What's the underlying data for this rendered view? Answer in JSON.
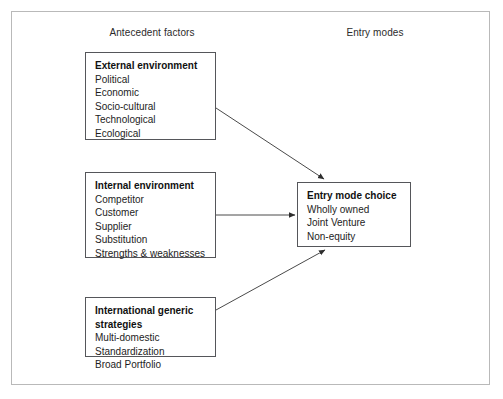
{
  "diagram": {
    "headers": {
      "left": "Antecedent factors",
      "right": "Entry modes"
    },
    "boxes": {
      "external": {
        "title": "External environment",
        "items": [
          "Political",
          "Economic",
          "Socio-cultural",
          "Technological",
          "Ecological"
        ]
      },
      "internal": {
        "title": "Internal environment",
        "items": [
          "Competitor",
          "Customer",
          "Supplier",
          "Substitution",
          "Strengths & weaknesses"
        ]
      },
      "international": {
        "title": "International generic strategies",
        "items": [
          "Multi-domestic",
          "Standardization",
          "Broad Portfolio"
        ]
      },
      "entry_mode": {
        "title": "Entry mode choice",
        "items": [
          "Wholly owned",
          "Joint Venture",
          "Non-equity"
        ]
      }
    },
    "connectors": [
      {
        "name": "external-to-entry-mode",
        "from": "external",
        "to": "entry_mode",
        "style": "diagonal-down"
      },
      {
        "name": "internal-to-entry-mode",
        "from": "internal",
        "to": "entry_mode",
        "style": "horizontal"
      },
      {
        "name": "international-to-entry-mode",
        "from": "international",
        "to": "entry_mode",
        "style": "diagonal-up"
      }
    ],
    "colors": {
      "frame": "#b9b9b9",
      "box_border": "#55565a",
      "text": "#1d1d1d",
      "arrow": "#3a3a3a",
      "background": "#ffffff"
    }
  }
}
